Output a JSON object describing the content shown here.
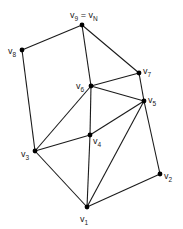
{
  "diagram": {
    "type": "planar-graph",
    "nodes": [
      {
        "id": "v1",
        "label": "v",
        "sub": "1",
        "x": 87,
        "y": 207,
        "lx": 80,
        "ly": 222
      },
      {
        "id": "v2",
        "label": "v",
        "sub": "2",
        "x": 160,
        "y": 174,
        "lx": 164,
        "ly": 179
      },
      {
        "id": "v3",
        "label": "v",
        "sub": "3",
        "x": 35,
        "y": 151,
        "lx": 21,
        "ly": 157
      },
      {
        "id": "v4",
        "label": "v",
        "sub": "4",
        "x": 90,
        "y": 135,
        "lx": 93,
        "ly": 144
      },
      {
        "id": "v5",
        "label": "v",
        "sub": "5",
        "x": 144,
        "y": 101,
        "lx": 148,
        "ly": 103
      },
      {
        "id": "v6",
        "label": "v",
        "sub": "6",
        "x": 91,
        "y": 86,
        "lx": 76,
        "ly": 89
      },
      {
        "id": "v7",
        "label": "v",
        "sub": "7",
        "x": 139,
        "y": 73,
        "lx": 143,
        "ly": 74
      },
      {
        "id": "v8",
        "label": "v",
        "sub": "8",
        "x": 22,
        "y": 50,
        "lx": 8,
        "ly": 54
      },
      {
        "id": "v9",
        "label": "v",
        "sub": "9",
        "x": 82,
        "y": 25,
        "lx": 70,
        "ly": 18,
        "extra": " = v",
        "extra_sub": "N"
      }
    ],
    "edges": [
      [
        "v9",
        "v8"
      ],
      [
        "v9",
        "v6"
      ],
      [
        "v9",
        "v7"
      ],
      [
        "v8",
        "v3"
      ],
      [
        "v7",
        "v6"
      ],
      [
        "v7",
        "v5"
      ],
      [
        "v6",
        "v5"
      ],
      [
        "v6",
        "v3"
      ],
      [
        "v6",
        "v4"
      ],
      [
        "v5",
        "v4"
      ],
      [
        "v5",
        "v1"
      ],
      [
        "v5",
        "v2"
      ],
      [
        "v4",
        "v3"
      ],
      [
        "v4",
        "v1"
      ],
      [
        "v3",
        "v1"
      ],
      [
        "v1",
        "v2"
      ]
    ]
  }
}
